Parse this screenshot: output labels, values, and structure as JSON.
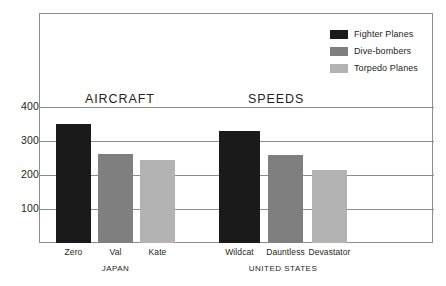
{
  "chart_data": {
    "type": "bar",
    "title": "AIRCRAFT SPEEDS",
    "title_parts": [
      "AIRCRAFT",
      "SPEEDS"
    ],
    "xlabel": "",
    "ylabel": "",
    "ylim": [
      0,
      440
    ],
    "yticks": [
      "400",
      "300",
      "200",
      "100"
    ],
    "ytick_values": [
      400,
      300,
      200,
      100
    ],
    "grid": true,
    "legend_position": "top-right",
    "categories": [
      "Zero",
      "Val",
      "Kate",
      "Wildcat",
      "Dauntless",
      "Devastator"
    ],
    "groups": [
      {
        "name": "JAPAN",
        "categories": [
          "Zero",
          "Val",
          "Kate"
        ]
      },
      {
        "name": "UNITED STATES",
        "categories": [
          "Wildcat",
          "Dauntless",
          "Devastator"
        ]
      }
    ],
    "series": [
      {
        "name": "Fighter Planes",
        "color": "#1a1a1a",
        "values": [
          350,
          null,
          null,
          330,
          null,
          null
        ]
      },
      {
        "name": "Dive-bombers",
        "color": "#7f7f7f",
        "values": [
          null,
          262,
          null,
          null,
          259,
          null
        ]
      },
      {
        "name": "Torpedo Planes",
        "color": "#b3b3b3",
        "values": [
          null,
          null,
          245,
          null,
          null,
          215
        ]
      }
    ],
    "bars": [
      {
        "label": "Zero",
        "group": "JAPAN",
        "series": "Fighter Planes",
        "value": 350,
        "color": "#1a1a1a"
      },
      {
        "label": "Val",
        "group": "JAPAN",
        "series": "Dive-bombers",
        "value": 262,
        "color": "#7f7f7f"
      },
      {
        "label": "Kate",
        "group": "JAPAN",
        "series": "Torpedo Planes",
        "value": 245,
        "color": "#b3b3b3"
      },
      {
        "label": "Wildcat",
        "group": "UNITED STATES",
        "series": "Fighter Planes",
        "value": 330,
        "color": "#1a1a1a"
      },
      {
        "label": "Dauntless",
        "group": "UNITED STATES",
        "series": "Dive-bombers",
        "value": 259,
        "color": "#7f7f7f"
      },
      {
        "label": "Devastator",
        "group": "UNITED STATES",
        "series": "Torpedo Planes",
        "value": 215,
        "color": "#b3b3b3"
      }
    ]
  },
  "legend": {
    "items": [
      {
        "label": "Fighter Planes",
        "color": "#1a1a1a"
      },
      {
        "label": "Dive-bombers",
        "color": "#7f7f7f"
      },
      {
        "label": "Torpedo Planes",
        "color": "#b3b3b3"
      }
    ]
  },
  "colors": {
    "background": "#ffffff",
    "axis": "#8c8c8c",
    "text": "#231f20",
    "fighter": "#1a1a1a",
    "divebomber": "#7f7f7f",
    "torpedo": "#b3b3b3"
  }
}
